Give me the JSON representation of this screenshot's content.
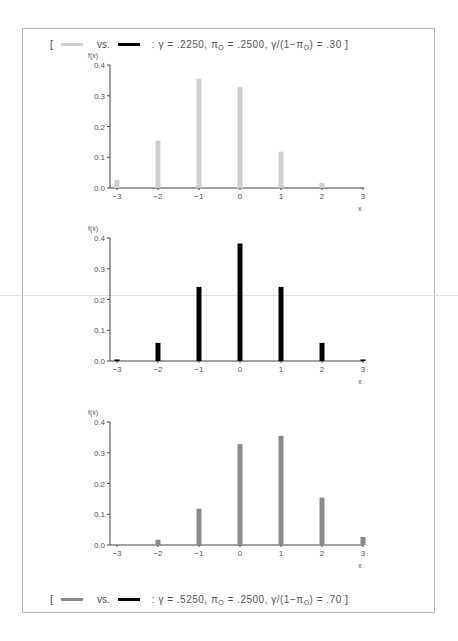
{
  "legend_top": {
    "open": "[",
    "vs": "vs.",
    "params": ": γ = .2250, π",
    "pi_sub": "O",
    "mid": " = .2500, γ/(1−π",
    "pi_sub2": "O",
    "end": ") = .30",
    "close": "]",
    "swatch1_color": "#cfcfcf",
    "swatch2_color": "#000000"
  },
  "legend_bottom": {
    "open": "[",
    "vs": "vs.",
    "params": ": γ = .5250, π",
    "pi_sub": "O",
    "mid": " = .2500, γ/(1−π",
    "pi_sub2": "O",
    "end": ") = .70",
    "close": "]",
    "swatch1_color": "#8a8a8a",
    "swatch2_color": "#000000"
  },
  "chart_data": [
    {
      "type": "bar",
      "title": "",
      "xlabel": "x",
      "ylabel": "f(x)",
      "categories": [
        "−3",
        "−2",
        "−1",
        "0",
        "1",
        "2",
        "3"
      ],
      "x": [
        -3,
        -2,
        -1,
        0,
        1,
        2,
        3
      ],
      "values": [
        0.026,
        0.154,
        0.355,
        0.328,
        0.118,
        0.017,
        0.0
      ],
      "ylim": [
        0,
        0.4
      ],
      "yticks": [
        "0.0",
        "0.1",
        "0.2",
        "0.3",
        "0.4"
      ],
      "color": "#cfcfcf",
      "grid": false,
      "legend": "γ = .2250, πO = .2500, γ/(1−πO) = .30"
    },
    {
      "type": "bar",
      "title": "",
      "xlabel": "x",
      "ylabel": "f(x)",
      "categories": [
        "−3",
        "−2",
        "−1",
        "0",
        "1",
        "2",
        "3"
      ],
      "x": [
        -3,
        -2,
        -1,
        0,
        1,
        2,
        3
      ],
      "values": [
        0.005,
        0.059,
        0.241,
        0.382,
        0.241,
        0.059,
        0.005
      ],
      "ylim": [
        0,
        0.4
      ],
      "yticks": [
        "0.0",
        "0.1",
        "0.2",
        "0.3",
        "0.4"
      ],
      "color": "#000000",
      "grid": false
    },
    {
      "type": "bar",
      "title": "",
      "xlabel": "x",
      "ylabel": "f(x)",
      "categories": [
        "−3",
        "−2",
        "−1",
        "0",
        "1",
        "2",
        "3"
      ],
      "x": [
        -3,
        -2,
        -1,
        0,
        1,
        2,
        3
      ],
      "values": [
        0.0,
        0.017,
        0.118,
        0.328,
        0.355,
        0.154,
        0.026
      ],
      "ylim": [
        0,
        0.4
      ],
      "yticks": [
        "0.0",
        "0.1",
        "0.2",
        "0.3",
        "0.4"
      ],
      "color": "#8a8a8a",
      "grid": false,
      "legend": "γ = .5250, πO = .2500, γ/(1−πO) = .70"
    }
  ]
}
